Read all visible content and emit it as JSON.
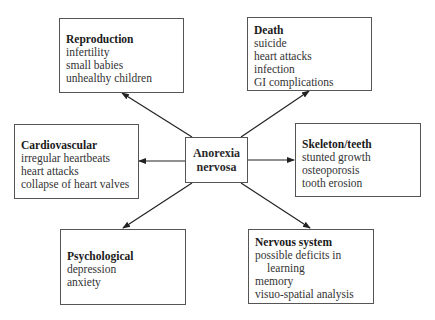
{
  "center": {
    "line1": "Anorexia",
    "line2": "nervosa"
  },
  "boxes": {
    "reproduction": {
      "title": "Reproduction",
      "items": [
        "infertility",
        "small babies",
        "unhealthy children"
      ]
    },
    "death": {
      "title": "Death",
      "items": [
        "suicide",
        "heart attacks",
        "infection",
        "GI complications"
      ]
    },
    "cardiovascular": {
      "title": "Cardiovascular",
      "items": [
        "irregular heartbeats",
        "heart attacks",
        "collapse of heart valves"
      ]
    },
    "skeleton": {
      "title": "Skeleton/teeth",
      "items": [
        "stunted growth",
        "osteoporosis",
        "tooth erosion"
      ]
    },
    "psychological": {
      "title": "Psychological",
      "items": [
        "depression",
        "anxiety"
      ]
    },
    "nervous": {
      "title": "Nervous system",
      "items": [
        "possible deficits in",
        "learning",
        "memory",
        "visuo-spatial analysis"
      ]
    }
  },
  "colors": {
    "line": "#222222",
    "border": "#555555"
  }
}
